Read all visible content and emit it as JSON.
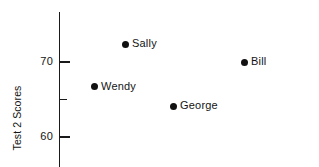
{
  "chart_data": {
    "type": "scatter",
    "title": "",
    "xlabel": "",
    "ylabel": "Test 2 Scores",
    "ylim": [
      56.0,
      76.5
    ],
    "grid": false,
    "legend": "none",
    "y_major_ticks": [
      {
        "value": 70,
        "label": "70"
      },
      {
        "value": 60,
        "label": "60"
      }
    ],
    "y_minor_ticks": [
      {
        "value": 65,
        "label": ""
      }
    ],
    "points": [
      {
        "name": "Sally",
        "label": "Sally",
        "y": 72.4,
        "x_px": 125,
        "y_value_display": "72.4"
      },
      {
        "name": "Bill",
        "label": "Bill",
        "y": 70.0,
        "x_px": 244,
        "y_value_display": "70.0"
      },
      {
        "name": "Wendy",
        "label": "Wendy",
        "y": 66.7,
        "x_px": 94,
        "y_value_display": "66.7"
      },
      {
        "name": "George",
        "label": "George",
        "y": 64.1,
        "x_px": 173,
        "y_value_display": "64.1"
      }
    ],
    "marker": {
      "shape": "circle",
      "color": "#111111",
      "size_px": 7
    },
    "axis_color": "#1a1a1a",
    "background_color": "#ffffff"
  }
}
